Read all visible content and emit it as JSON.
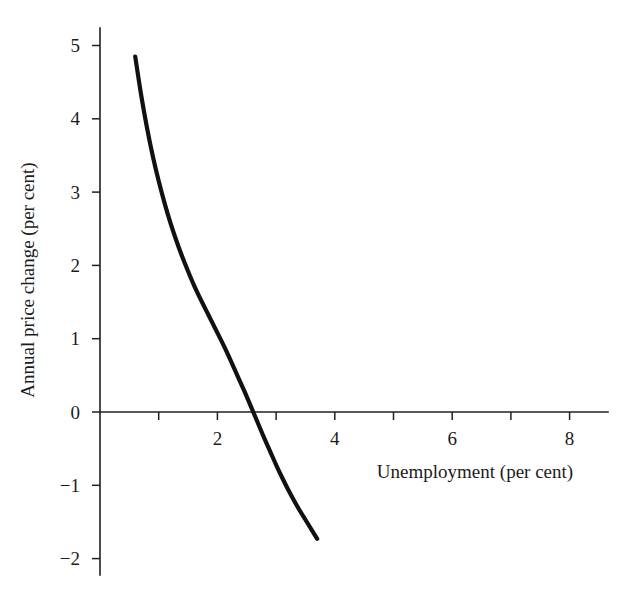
{
  "chart_data": {
    "type": "line",
    "title": "",
    "subtitle": "",
    "xlabel": "Unemployment (per cent)",
    "ylabel": "Annual price change (per cent)",
    "xlim": [
      0,
      8.65
    ],
    "ylim": [
      -2.25,
      5.45
    ],
    "xticks": [
      2,
      4,
      6,
      8
    ],
    "xtick_labels": [
      "2",
      "4",
      "6",
      "8"
    ],
    "yticks": [
      5,
      4,
      3,
      2,
      1,
      0,
      -1,
      -2
    ],
    "ytick_labels": [
      "5",
      "4",
      "3",
      "2",
      "1",
      "0",
      "−1",
      "−2"
    ],
    "grid": false,
    "legend": null,
    "annotations": [],
    "series": [
      {
        "name": "Phillips curve",
        "color": "#111111",
        "line_width": 4.2,
        "x": [
          0.6,
          0.7,
          0.8,
          0.9,
          1.0,
          1.1,
          1.2,
          1.3,
          1.4,
          1.5,
          1.6,
          1.7,
          1.8,
          1.9,
          2.0,
          2.1,
          2.2,
          2.3,
          2.4,
          2.5,
          2.6,
          2.7,
          2.8,
          2.9,
          3.0,
          3.1,
          3.2,
          3.3,
          3.4,
          3.5,
          3.6,
          3.7
        ],
        "y": [
          4.85,
          4.33,
          3.88,
          3.49,
          3.15,
          2.85,
          2.58,
          2.34,
          2.12,
          1.92,
          1.73,
          1.56,
          1.4,
          1.24,
          1.08,
          0.92,
          0.75,
          0.57,
          0.39,
          0.21,
          0.02,
          -0.17,
          -0.36,
          -0.54,
          -0.72,
          -0.89,
          -1.05,
          -1.2,
          -1.34,
          -1.47,
          -1.6,
          -1.73
        ],
        "zero_crossing_x": 2.21
      }
    ]
  },
  "axes": {
    "y_axis_name": "vertical-axis",
    "x_axis_name": "horizontal-axis"
  }
}
